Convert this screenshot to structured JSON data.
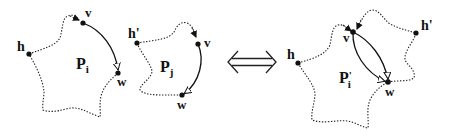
{
  "figure": {
    "left_panel": {
      "polygon_i": {
        "label_main": "P",
        "label_sub": "i",
        "vertices": {
          "h": "h",
          "v": "v",
          "w": "w"
        }
      },
      "polygon_j": {
        "label_main": "P",
        "label_sub": "j",
        "vertices": {
          "h": "h'",
          "v": "v",
          "w": "w"
        }
      }
    },
    "equivalence_symbol": "⟺",
    "right_panel": {
      "merged_polygon": {
        "label_main": "P",
        "label_prime": "'",
        "label_sub": "i",
        "vertices": {
          "h": "h",
          "h_prime": "h'",
          "v": "v",
          "w": "w"
        }
      }
    },
    "colors": {
      "stroke": "#111111",
      "background": "#ffffff"
    }
  }
}
